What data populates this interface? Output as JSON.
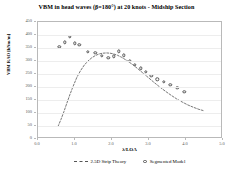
{
  "chart_data": {
    "type": "scatter",
    "title": "VBM in head waves (β=180°) at 20 knots  -  Midship Section",
    "xlabel": "λ/LOA",
    "ylabel": "VBM RAO [kNm/m]",
    "xlim": [
      0.0,
      5.0
    ],
    "ylim": [
      0,
      450
    ],
    "xticks": [
      "0.0",
      "1.0",
      "2.0",
      "3.0",
      "4.0",
      "5.0"
    ],
    "xtick_values": [
      0.0,
      1.0,
      2.0,
      3.0,
      4.0,
      5.0
    ],
    "yticks": [
      "0",
      "50",
      "100",
      "150",
      "200",
      "250",
      "300",
      "350",
      "400",
      "450"
    ],
    "ytick_values": [
      0,
      50,
      100,
      150,
      200,
      250,
      300,
      350,
      400,
      450
    ],
    "grid": true,
    "legend_position": "bottom",
    "series": [
      {
        "name": "2.5D Strip Theory",
        "style": "dashed-line",
        "color": "#555555",
        "x": [
          0.54,
          0.62,
          0.7,
          0.78,
          0.86,
          0.95,
          1.05,
          1.15,
          1.25,
          1.35,
          1.45,
          1.55,
          1.65,
          1.75,
          1.85,
          1.95,
          2.05,
          2.15,
          2.25,
          2.4,
          2.55,
          2.7,
          2.85,
          3.0,
          3.15,
          3.3,
          3.45,
          3.6,
          3.75,
          3.9,
          4.05,
          4.2,
          4.35,
          4.5
        ],
        "y": [
          48,
          75,
          105,
          138,
          170,
          203,
          237,
          263,
          284,
          300,
          312,
          321,
          327,
          330,
          331,
          330,
          327,
          322,
          315,
          302,
          287,
          270,
          252,
          234,
          216,
          199,
          183,
          168,
          154,
          142,
          131,
          122,
          114,
          108
        ]
      },
      {
        "name": "Segmented Model",
        "style": "open-circle",
        "color": "#555555",
        "x": [
          0.58,
          0.72,
          0.86,
          1.0,
          1.12,
          1.34,
          1.55,
          1.72,
          1.9,
          2.05,
          2.18,
          2.32,
          2.48,
          2.62,
          2.78,
          2.92,
          3.06,
          3.22,
          3.4,
          3.58,
          3.76,
          3.95
        ],
        "y": [
          355,
          372,
          392,
          368,
          362,
          335,
          332,
          320,
          312,
          318,
          338,
          322,
          300,
          285,
          272,
          258,
          244,
          230,
          219,
          208,
          196,
          182
        ]
      }
    ]
  }
}
